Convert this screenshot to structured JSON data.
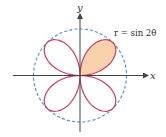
{
  "figure": {
    "equation": "r = sin 2θ",
    "x_axis_label": "x",
    "y_axis_label": "y",
    "curve": "four-leaved rose r = sin 2θ",
    "highlighted_petal": "first quadrant",
    "reference_circle": "unit circle (dashed)"
  },
  "colors": {
    "petal_stroke": "#cc3d63",
    "petal_fill": "#f9d1ad",
    "circle": "#4b8ec9",
    "axes": "#444444"
  }
}
